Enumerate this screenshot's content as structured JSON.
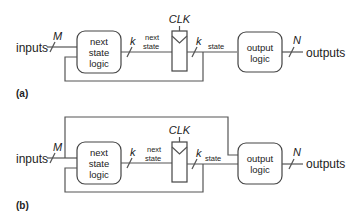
{
  "diagram_a": {
    "label": "(a)",
    "inputs_label": "inputs",
    "inputs_width": "M",
    "next_state_logic": [
      "next",
      "state",
      "logic"
    ],
    "next_state_width": "k",
    "next_state_signal": [
      "next",
      "state"
    ],
    "clock_label": "CLK",
    "state_width": "k",
    "state_signal": "state",
    "output_logic": [
      "output",
      "logic"
    ],
    "outputs_width": "N",
    "outputs_label": "outputs"
  },
  "diagram_b": {
    "label": "(b)",
    "inputs_label": "inputs",
    "inputs_width": "M",
    "next_state_logic": [
      "next",
      "state",
      "logic"
    ],
    "next_state_width": "k",
    "next_state_signal": [
      "next",
      "state"
    ],
    "clock_label": "CLK",
    "state_width": "k",
    "state_signal": "state",
    "output_logic": [
      "output",
      "logic"
    ],
    "outputs_width": "N",
    "outputs_label": "outputs"
  }
}
